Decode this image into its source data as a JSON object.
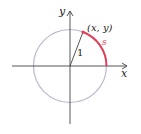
{
  "diagram": {
    "axis_x_label": "x",
    "axis_y_label": "y",
    "point_label": "(x, y)",
    "radius_label": "1",
    "arc_label": "s",
    "colors": {
      "circle": "#b7b9cf",
      "arc": "#e0405a",
      "axes": "#444444",
      "text": "#222222"
    }
  }
}
